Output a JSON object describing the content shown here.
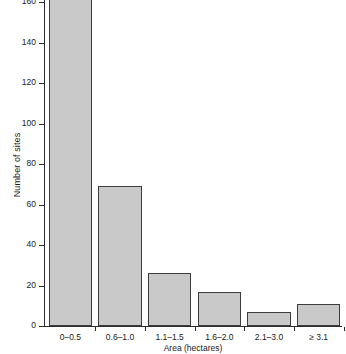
{
  "chart_data": {
    "type": "bar",
    "title": "",
    "subtitle": "",
    "xlabel": "Area (hectares)",
    "ylabel": "Number of sites",
    "categories": [
      "0–0.5",
      "0.6–1.0",
      "1.1–1.5",
      "1.6–2.0",
      "2.1–3.0",
      "≥ 3.1"
    ],
    "values": [
      163,
      69,
      26,
      17,
      7,
      11
    ],
    "ylim": [
      0,
      163
    ],
    "yticks": [
      0,
      20,
      40,
      60,
      80,
      100,
      120,
      140,
      160
    ],
    "ytick_labels": [
      "0",
      "20",
      "40",
      "60",
      "80",
      "100",
      "120",
      "140",
      "160"
    ],
    "grid": false,
    "legend": false,
    "legend_position": "none",
    "bar_fill_color": "#c9c9c9",
    "bar_edge_color": "#3d3d3d",
    "axis_color": "#2b2b2b",
    "background_color": "#ffffff",
    "note": "Top bar is clipped by the top edge of the figure"
  }
}
